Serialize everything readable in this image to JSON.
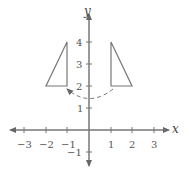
{
  "axes": {
    "x_label": "x",
    "y_label": "y",
    "x_ticks": [
      "−3",
      "−2",
      "−1",
      "1",
      "2",
      "3"
    ],
    "y_ticks": [
      "4",
      "3",
      "2",
      "1",
      "−1"
    ]
  },
  "shapes": {
    "left_triangle": "(-2,2), (-1,2), (-1,4)",
    "right_triangle": "(1,2), (2,2), (1,4)",
    "arrow": "dashed arc from right triangle to left triangle"
  },
  "colors": {
    "stroke": "#777777"
  }
}
